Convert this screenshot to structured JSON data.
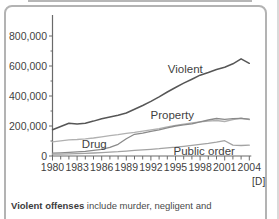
{
  "figure": {
    "marker": "[D]",
    "caption_lead": "Violent offenses",
    "caption_rest": " include murder, negligent and"
  },
  "chart_data": {
    "type": "line",
    "title": "",
    "xlabel": "",
    "ylabel": "",
    "x": [
      1980,
      1981,
      1982,
      1983,
      1984,
      1985,
      1986,
      1987,
      1988,
      1989,
      1990,
      1991,
      1992,
      1993,
      1994,
      1995,
      1996,
      1997,
      1998,
      1999,
      2000,
      2001,
      2002,
      2003,
      2004
    ],
    "x_label_years": [
      1980,
      1983,
      1986,
      1989,
      1992,
      1995,
      1998,
      2001,
      2004
    ],
    "ylim": [
      0,
      900000
    ],
    "y_major_ticks": [
      0,
      200000,
      400000,
      600000,
      800000
    ],
    "y_major_labels": [
      "0",
      "200,000",
      "400,000",
      "600,000",
      "800,000"
    ],
    "y_minor_ticks": [
      100000,
      300000,
      500000,
      700000
    ],
    "grid": false,
    "legend": "inline-labels",
    "series": [
      {
        "name": "Violent",
        "color": "#565656",
        "width": 1.5,
        "values": [
          175000,
          197000,
          218000,
          213000,
          219000,
          233000,
          248000,
          260000,
          271000,
          287000,
          311000,
          337000,
          364000,
          394000,
          427000,
          457000,
          486000,
          512000,
          539000,
          557000,
          577000,
          592000,
          615000,
          648000,
          618000
        ]
      },
      {
        "name": "Property",
        "color": "#b1b1b1",
        "width": 1.3,
        "values": [
          95000,
          101000,
          107000,
          110000,
          114000,
          120000,
          128000,
          136000,
          143000,
          151000,
          158000,
          166000,
          174000,
          183000,
          194000,
          205000,
          213000,
          220000,
          228000,
          233000,
          237000,
          230000,
          243000,
          252000,
          242000
        ]
      },
      {
        "name": "Drug",
        "color": "#8a8a8a",
        "width": 1.3,
        "values": [
          19000,
          21000,
          24000,
          27000,
          31000,
          38000,
          45000,
          57000,
          78000,
          115000,
          145000,
          153000,
          165000,
          175000,
          188000,
          200000,
          208000,
          215000,
          228000,
          240000,
          250000,
          245000,
          249000,
          250000,
          246000
        ]
      },
      {
        "name": "Public order",
        "color": "#a3a3a3",
        "width": 1.3,
        "values": [
          12000,
          13000,
          15000,
          16000,
          18000,
          20000,
          23000,
          26000,
          29000,
          33000,
          37000,
          41000,
          45000,
          49000,
          54000,
          59000,
          65000,
          71000,
          78000,
          85000,
          93000,
          102000,
          73000,
          70000,
          72000
        ]
      }
    ],
    "annotations": [
      {
        "text": "Violent",
        "year": 1996.2,
        "value": 580000
      },
      {
        "text": "Property",
        "year": 1994.6,
        "value": 273000
      },
      {
        "text": "Drug",
        "year": 1985.1,
        "value": 83000
      },
      {
        "text": "Public order",
        "year": 1998.5,
        "value": 33000
      }
    ]
  }
}
